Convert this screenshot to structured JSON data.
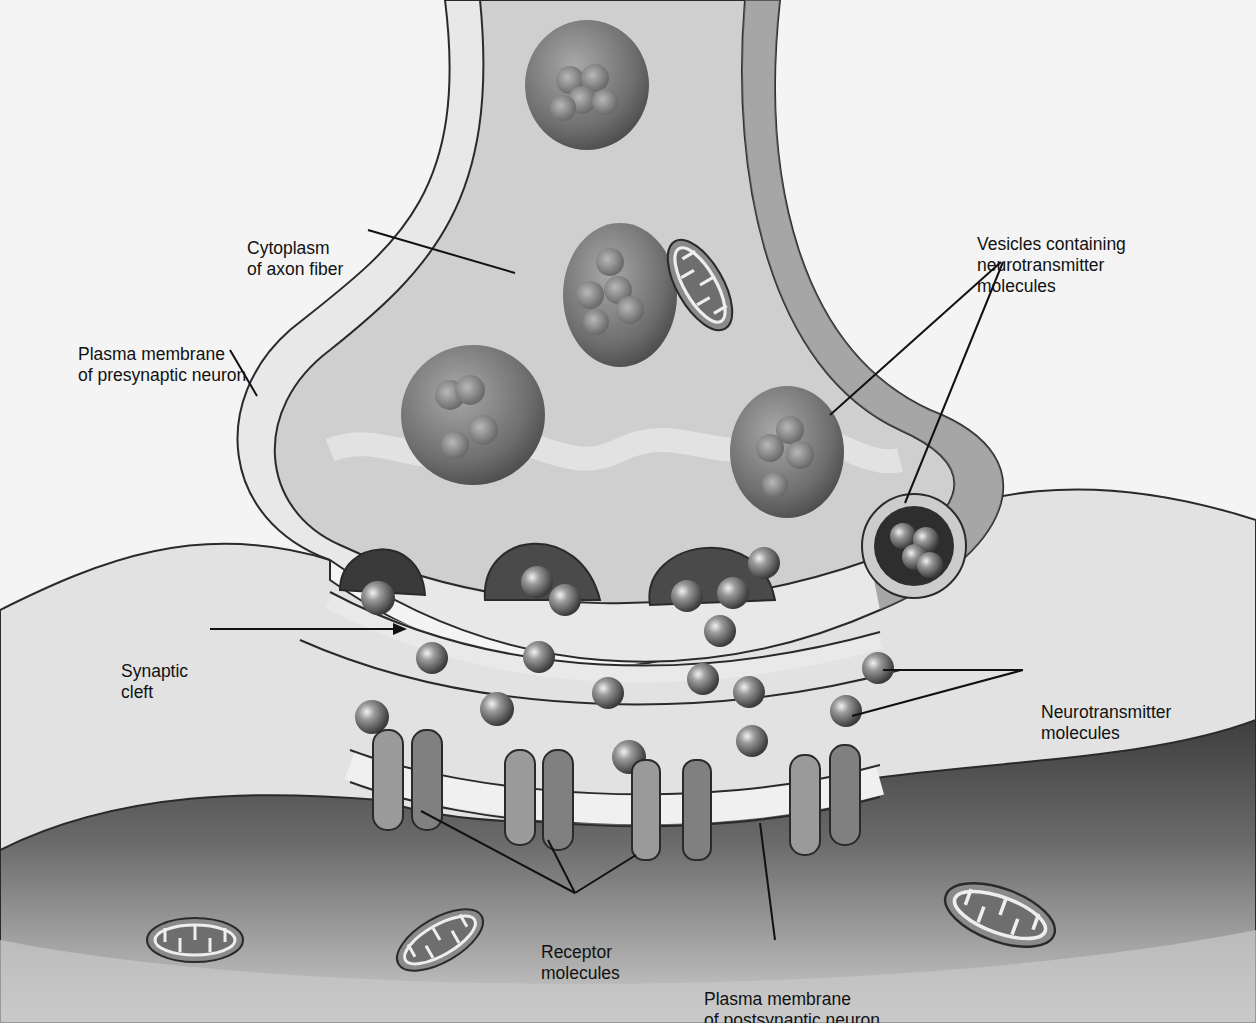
{
  "diagram": {
    "colors": {
      "background": "#f4f4f4",
      "cytoplasm": "#cfcfcf",
      "membrane_band": "#e6e6e6",
      "outline": "#2a2a2a",
      "vesicle": "#7a7a7a",
      "molecule": "#6a6a6a",
      "postsynaptic_dark": "#5a5a5a",
      "leader_line": "#111111"
    },
    "labels": [
      {
        "id": "cytoplasm",
        "lines": [
          "Cytoplasm",
          "of axon fiber"
        ]
      },
      {
        "id": "presynaptic-membrane",
        "lines": [
          "Plasma membrane",
          "of presynaptic neuron"
        ]
      },
      {
        "id": "vesicles",
        "lines": [
          "Vesicles containing",
          "neurotransmitter",
          "molecules"
        ]
      },
      {
        "id": "synaptic-cleft",
        "lines": [
          "Synaptic",
          "cleft"
        ]
      },
      {
        "id": "neurotransmitter",
        "lines": [
          "Neurotransmitter",
          "molecules"
        ]
      },
      {
        "id": "receptor",
        "lines": [
          "Receptor",
          "molecules"
        ]
      },
      {
        "id": "postsynaptic-membrane",
        "lines": [
          "Plasma membrane",
          "of postsynaptic neuron"
        ]
      }
    ]
  }
}
